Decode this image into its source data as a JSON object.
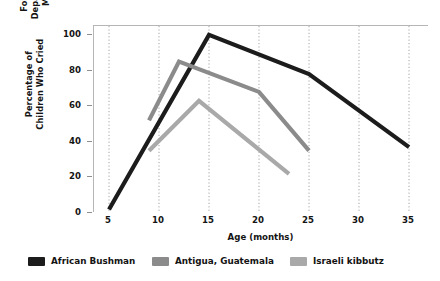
{
  "chart_data": {
    "type": "line",
    "title": "",
    "xlabel": "Age (months)",
    "ylabel": "Percentage of Children Who Cried\nFollowing Departure of Mother",
    "xlim": [
      3.5,
      37
    ],
    "ylim": [
      0,
      105
    ],
    "xticks": [
      5,
      10,
      15,
      20,
      25,
      30,
      35
    ],
    "yticks": [
      0,
      20,
      40,
      60,
      80,
      100
    ],
    "grid": "vertical-dotted",
    "legend_position": "below",
    "series": [
      {
        "name": "African Bushman",
        "color": "#1c1c1c",
        "x": [
          5,
          15,
          25,
          35
        ],
        "values": [
          2,
          100,
          78,
          37
        ]
      },
      {
        "name": "Antigua, Guatemala",
        "color": "#8b8b8b",
        "x": [
          9,
          12,
          20,
          25
        ],
        "values": [
          52,
          85,
          68,
          35
        ]
      },
      {
        "name": "Israeli kibbutz",
        "color": "#a9a9a9",
        "x": [
          9,
          14,
          23
        ],
        "values": [
          35,
          63,
          22
        ]
      }
    ]
  },
  "axes": {
    "y_title_line1": "Percentage of Children Who Cried",
    "y_title_line2": "Following Departure of Mother",
    "x_title": "Age (months)",
    "y_tick_labels": [
      "0",
      "20",
      "40",
      "60",
      "80",
      "100"
    ],
    "x_tick_labels": [
      "5",
      "10",
      "15",
      "20",
      "25",
      "30",
      "35"
    ]
  },
  "legend": {
    "items": [
      {
        "label": "African Bushman",
        "color": "#1c1c1c"
      },
      {
        "label": "Antigua, Guatemala",
        "color": "#8b8b8b"
      },
      {
        "label": "Israeli kibbutz",
        "color": "#a9a9a9"
      }
    ]
  },
  "colors": {
    "background": "#ffffff",
    "frame": "#b6b6b6",
    "gridline": "#9a9a9a",
    "text": "#141414"
  }
}
